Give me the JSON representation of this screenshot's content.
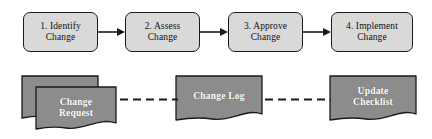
{
  "diagram": {
    "background_color": "#ffffff",
    "process_fill": "#d9d9d9",
    "process_stroke": "#1a1a1a",
    "document_fill": "#8c8c8c",
    "document_stroke": "#1a1a1a",
    "document_text_color": "#ffffff",
    "connector_color": "#1a1a1a"
  },
  "process_steps": [
    {
      "label": "1. Identify\nChange",
      "number": "1",
      "name": "Identify Change"
    },
    {
      "label": "2. Assess\nChange",
      "number": "2",
      "name": "Assess Change"
    },
    {
      "label": "3. Approve\nChange",
      "number": "3",
      "name": "Approve Change"
    },
    {
      "label": "4. Implement\nChange",
      "number": "4",
      "name": "Implement Change"
    }
  ],
  "arrows": [
    {
      "name": "arrow-step1-to-step2",
      "style": "solid",
      "direction": "right"
    },
    {
      "name": "arrow-step2-to-step3",
      "style": "solid",
      "direction": "right"
    },
    {
      "name": "arrow-step3-to-step4",
      "style": "solid",
      "direction": "right"
    }
  ],
  "documents": [
    {
      "label": "Change\nRequest",
      "stacked": "true",
      "name": "Change Request"
    },
    {
      "label": "Change Log",
      "stacked": "false",
      "name": "Change Log"
    },
    {
      "label": "Update\nChecklist",
      "stacked": "false",
      "name": "Update Checklist"
    }
  ],
  "dashed_links": [
    {
      "name": "link-change-request-to-change-log",
      "style": "dashed"
    },
    {
      "name": "link-change-log-to-update-checklist",
      "style": "dashed"
    }
  ]
}
